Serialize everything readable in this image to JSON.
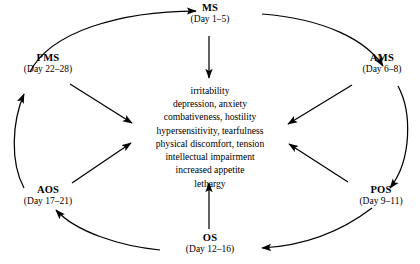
{
  "diagram": {
    "stroke_color": "#000000",
    "background_color": "#ffffff",
    "nodes": [
      {
        "id": "ms",
        "abbr": "MS",
        "days": "(Day 1–5)"
      },
      {
        "id": "ams",
        "abbr": "AMS",
        "days": "(Day 6–8)"
      },
      {
        "id": "pos",
        "abbr": "POS",
        "days": "(Day 9–11)"
      },
      {
        "id": "os",
        "abbr": "OS",
        "days": "(Day 12–16)"
      },
      {
        "id": "aos",
        "abbr": "AOS",
        "days": "(Day 17–21)"
      },
      {
        "id": "pms",
        "abbr": "PMS",
        "days": "(Day 22–28)"
      }
    ],
    "symptoms": [
      "irritability",
      "depression, anxiety",
      "combativeness, hostility",
      "hypersensitivity, tearfulness",
      "physical discomfort, tension",
      "intellectual impairment",
      "increased appetite",
      "lethargy"
    ],
    "cycle_arrows": [
      {
        "from": "PMS",
        "to": "MS"
      },
      {
        "from": "MS",
        "to": "AMS"
      },
      {
        "from": "AMS",
        "to": "POS"
      },
      {
        "from": "POS",
        "to": "OS"
      },
      {
        "from": "OS",
        "to": "AOS"
      },
      {
        "from": "AOS",
        "to": "PMS"
      }
    ],
    "inward_arrows": [
      {
        "from": "MS",
        "to": "symptoms"
      },
      {
        "from": "AMS",
        "to": "symptoms"
      },
      {
        "from": "POS",
        "to": "symptoms"
      },
      {
        "from": "OS",
        "to": "symptoms"
      },
      {
        "from": "AOS",
        "to": "symptoms"
      },
      {
        "from": "PMS",
        "to": "symptoms"
      }
    ]
  }
}
